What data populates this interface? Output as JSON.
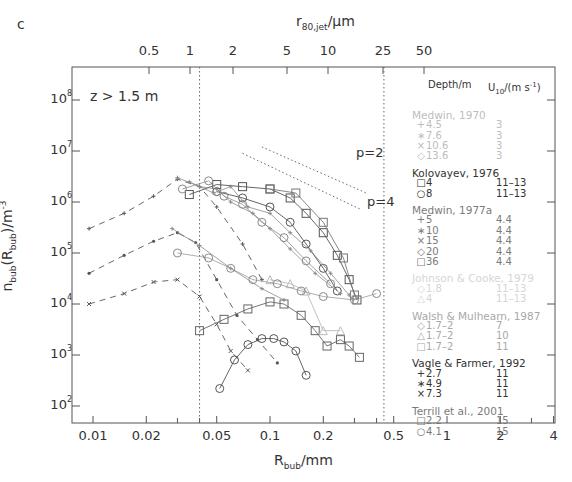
{
  "panel_label": "c",
  "depth_annotation": "z > 1.5 m",
  "top_axis": {
    "title_main": "r",
    "title_sub": "80,jet",
    "title_unit": "/µm",
    "ticks": [
      {
        "label": "0.5",
        "x": 149
      },
      {
        "label": "1",
        "x": 190
      },
      {
        "label": "2",
        "x": 233
      },
      {
        "label": "5",
        "x": 287
      },
      {
        "label": "10",
        "x": 328
      },
      {
        "label": "25",
        "x": 383
      },
      {
        "label": "50",
        "x": 424
      }
    ]
  },
  "bottom_axis": {
    "title_main": "R",
    "title_sub": "bub",
    "title_unit": "/mm"
  },
  "y_axis": {
    "title": "n_bub(R_bub)/m^-3"
  },
  "p_labels": [
    {
      "text": "p=2",
      "x": 356,
      "y": 145
    },
    {
      "text": "p=4",
      "x": 367,
      "y": 194
    }
  ],
  "legend": {
    "header_depth": "Depth/m",
    "header_wind": "U10/(m s-1)",
    "groups": [
      {
        "title": "Medwin, 1970",
        "color": "#bdbdbd",
        "rows": [
          {
            "sym": "+",
            "depth": "4.5",
            "wind": "3"
          },
          {
            "sym": "∗",
            "depth": "7.6",
            "wind": "3"
          },
          {
            "sym": "×",
            "depth": "10.6",
            "wind": "3"
          },
          {
            "sym": "◇",
            "depth": "13.6",
            "wind": "3"
          }
        ]
      },
      {
        "title": "Kolovayev, 1976",
        "color": "#333333",
        "rows": [
          {
            "sym": "□",
            "depth": "4",
            "wind": "11–13"
          },
          {
            "sym": "○",
            "depth": "8",
            "wind": "11–13"
          }
        ]
      },
      {
        "title": "Medwin, 1977a",
        "color": "#7a7a7a",
        "rows": [
          {
            "sym": "+",
            "depth": "5",
            "wind": "4.4"
          },
          {
            "sym": "∗",
            "depth": "10",
            "wind": "4.4"
          },
          {
            "sym": "×",
            "depth": "15",
            "wind": "4.4"
          },
          {
            "sym": "◇",
            "depth": "20",
            "wind": "4.4"
          },
          {
            "sym": "□",
            "depth": "36",
            "wind": "4.4"
          }
        ]
      },
      {
        "title": "Johnson & Cooke, 1979",
        "color": "#d6d6d6",
        "rows": [
          {
            "sym": "◇",
            "depth": "1.8",
            "wind": "11–13"
          },
          {
            "sym": "△",
            "depth": "4",
            "wind": "11–13"
          }
        ]
      },
      {
        "title": "Walsh & Mulhearn, 1987",
        "color": "#a8a8a8",
        "rows": [
          {
            "sym": "◇",
            "depth": "1.7–2",
            "wind": "7"
          },
          {
            "sym": "△",
            "depth": "1.7–2",
            "wind": "10"
          },
          {
            "sym": "□",
            "depth": "1.7–2",
            "wind": "11"
          }
        ]
      },
      {
        "title": "Vagle & Farmer, 1992",
        "color": "#333333",
        "rows": [
          {
            "sym": "+",
            "depth": "2.7",
            "wind": "11"
          },
          {
            "sym": "∗",
            "depth": "4.9",
            "wind": "11"
          },
          {
            "sym": "×",
            "depth": "7.3",
            "wind": "11"
          }
        ]
      },
      {
        "title": "Terrill et al., 2001",
        "color": "#7a7a7a",
        "rows": [
          {
            "sym": "□",
            "depth": "2.2",
            "wind": "15"
          },
          {
            "sym": "○",
            "depth": "4.1",
            "wind": "15"
          }
        ]
      }
    ]
  },
  "chart_data": {
    "type": "line",
    "title": "",
    "panel": "c",
    "annotation": "z > 1.5 m",
    "xlabel": "R_bub/mm",
    "ylabel": "n_bub(R_bub)/m^-3",
    "top_xlabel": "r_80,jet/µm",
    "xscale": "log",
    "yscale": "log",
    "xlim": [
      0.0075,
      4
    ],
    "ylim": [
      50,
      300000000.0
    ],
    "x_ticks": [
      "0.01",
      "0.02",
      "0.05",
      "0.1",
      "0.2",
      "0.5",
      "1",
      "2",
      "4"
    ],
    "y_ticks": [
      "10^2",
      "10^3",
      "10^4",
      "10^5",
      "10^6",
      "10^7",
      "10^8"
    ],
    "top_ticks": [
      "0.5",
      "1",
      "2",
      "5",
      "10",
      "25",
      "50"
    ],
    "vertical_reference_lines": [
      0.04,
      0.44
    ],
    "slope_guides": [
      {
        "label": "p=2",
        "x": [
          0.09,
          0.35
        ],
        "y": [
          12000000.0,
          1500000.0
        ]
      },
      {
        "label": "p=4",
        "x": [
          0.07,
          0.33
        ],
        "y": [
          9000000.0,
          700000.0
        ]
      }
    ],
    "grid": false,
    "legend_position": "right",
    "series": [
      {
        "name": "Vagle & Farmer 1992, 2.7 m",
        "marker": "+",
        "style": "dashed",
        "color": "#555",
        "x": [
          0.0095,
          0.015,
          0.022,
          0.03,
          0.04,
          0.05,
          0.07,
          0.09
        ],
        "y": [
          300000.0,
          600000.0,
          1300000.0,
          2800000.0,
          2000000.0,
          800000.0,
          150000.0,
          30000.0
        ]
      },
      {
        "name": "Vagle & Farmer 1992, 4.9 m",
        "marker": "*",
        "style": "dashed",
        "color": "#555",
        "x": [
          0.0095,
          0.015,
          0.022,
          0.03,
          0.038,
          0.05,
          0.065,
          0.085,
          0.11
        ],
        "y": [
          40000.0,
          90000.0,
          170000.0,
          250000.0,
          160000.0,
          30000.0,
          6000.0,
          2000.0,
          700.0
        ]
      },
      {
        "name": "Vagle & Farmer 1992, 7.3 m",
        "marker": "x",
        "style": "dashed",
        "color": "#555",
        "x": [
          0.0095,
          0.015,
          0.022,
          0.03,
          0.04,
          0.05,
          0.06,
          0.075
        ],
        "y": [
          10000.0,
          16000.0,
          27000.0,
          30000.0,
          14000.0,
          4000.0,
          1200.0,
          500.0
        ]
      },
      {
        "name": "Kolovayev 1976, 4 m",
        "marker": "square",
        "style": "solid",
        "color": "#555",
        "x": [
          0.035,
          0.05,
          0.07,
          0.1,
          0.13,
          0.16,
          0.2,
          0.24,
          0.28,
          0.31
        ],
        "y": [
          1400000.0,
          2200000.0,
          2000000.0,
          1800000.0,
          1200000.0,
          600000.0,
          250000.0,
          90000.0,
          30000.0,
          12000.0
        ]
      },
      {
        "name": "Kolovayev 1976, 8 m",
        "marker": "circle",
        "style": "solid",
        "color": "#555",
        "x": [
          0.05,
          0.07,
          0.1,
          0.13,
          0.16,
          0.2,
          0.24
        ],
        "y": [
          1600000.0,
          1200000.0,
          800000.0,
          400000.0,
          150000.0,
          50000.0,
          18000.0
        ]
      },
      {
        "name": "Walsh & Mulhearn 1987, 1.7-2 m, 11 m/s",
        "marker": "square",
        "style": "solid",
        "color": "#666",
        "x": [
          0.04,
          0.055,
          0.075,
          0.1,
          0.12,
          0.15,
          0.18,
          0.21,
          0.25,
          0.28,
          0.32
        ],
        "y": [
          3000.0,
          5000.0,
          8000.0,
          11000.0,
          10000.0,
          6000.0,
          3000.0,
          1500.0,
          2000.0,
          1500.0,
          900.0
        ]
      },
      {
        "name": "Terrill et al. 2001, 4.1 m",
        "marker": "circle",
        "style": "solid",
        "color": "#555",
        "x": [
          0.052,
          0.063,
          0.075,
          0.09,
          0.105,
          0.12,
          0.14,
          0.16
        ],
        "y": [
          220.0,
          800.0,
          1600.0,
          2100.0,
          2100.0,
          1800.0,
          1200.0,
          400.0
        ]
      },
      {
        "name": "Medwin 1977a, 36 m",
        "marker": "square",
        "style": "solid",
        "color": "#777",
        "x": [
          0.1,
          0.14,
          0.2,
          0.26,
          0.3
        ],
        "y": [
          1800000.0,
          1500000.0,
          400000.0,
          80000.0,
          15000.0
        ]
      },
      {
        "name": "Johnson & Cooke 1979, 4 m",
        "marker": "triangle",
        "style": "solid",
        "color": "#bbb",
        "x": [
          0.1,
          0.13,
          0.16,
          0.2,
          0.25
        ],
        "y": [
          30000.0,
          25000.0,
          18000.0,
          3000.0,
          3000.0
        ]
      }
    ]
  }
}
